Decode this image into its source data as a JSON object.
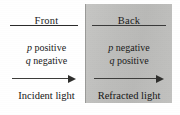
{
  "figure": {
    "divider_label": "surface-boundary"
  },
  "panels": [
    {
      "id": "front",
      "heading": "Front",
      "sign_lines": [
        {
          "variable": "p",
          "sign": "positive"
        },
        {
          "variable": "q",
          "sign": "negative"
        }
      ],
      "arrow": {
        "direction": "right",
        "icon": "right-arrow-icon"
      },
      "caption": "Incident light",
      "background_color": "#ffffff"
    },
    {
      "id": "back",
      "heading": "Back",
      "sign_lines": [
        {
          "variable": "p",
          "sign": "negative"
        },
        {
          "variable": "q",
          "sign": "positive"
        }
      ],
      "arrow": {
        "direction": "right",
        "icon": "right-arrow-icon"
      },
      "caption": "Refracted light",
      "background_color": "#bfbfbd"
    }
  ],
  "colors": {
    "text": "#1a1a1a",
    "rule": "#2b2b2b",
    "arrow": "#2f2f2d",
    "panel_front_bg": "#ffffff",
    "panel_back_bg": "#bfbfbd",
    "divider": "#9a9a98"
  }
}
